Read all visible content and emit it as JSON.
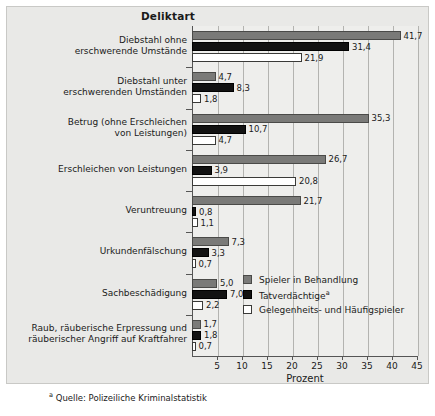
{
  "chart_data": {
    "type": "bar",
    "orientation": "horizontal",
    "title": "Deliktart",
    "xlabel": "Prozent",
    "ylabel": "Deliktart",
    "xlim": [
      0,
      45
    ],
    "xticks": [
      5,
      10,
      15,
      20,
      25,
      30,
      35,
      40,
      45
    ],
    "xticklabels": [
      "5",
      "10",
      "15",
      "20",
      "25",
      "30",
      "35",
      "40",
      "45"
    ],
    "grid": "vertical",
    "legend_position": "center-right-inside",
    "categories": [
      "Diebstahl ohne erschwerende Umstände",
      "Diebstahl unter erschwerenden Umständen",
      "Betrug (ohne Erschleichen von Leistungen)",
      "Erschleichen von Leistungen",
      "Veruntreuung",
      "Urkundenfälschung",
      "Sachbeschädigung",
      "Raub, räuberische Erpressung und räuberischer Angriff auf Kraftfahrer"
    ],
    "category_lines": [
      [
        "Diebstahl ohne",
        "erschwerende Umstände"
      ],
      [
        "Diebstahl unter",
        "erschwerenden Umständen"
      ],
      [
        "Betrug (ohne Erschleichen",
        "von Leistungen)"
      ],
      [
        "Erschleichen von Leistungen"
      ],
      [
        "Veruntreuung"
      ],
      [
        "Urkundenfälschung"
      ],
      [
        "Sachbeschädigung"
      ],
      [
        "Raub, räuberische Erpressung und",
        "räuberischer Angriff auf Kraftfahrer"
      ]
    ],
    "series": [
      {
        "name": "Spieler in Behandlung",
        "color": "#7a7a78",
        "values": [
          41.7,
          4.7,
          35.3,
          26.7,
          21.7,
          7.3,
          5.0,
          1.7
        ],
        "labels": [
          "41,7",
          "4,7",
          "35,3",
          "26,7",
          "21,7",
          "7,3",
          "5,0",
          "1,7"
        ]
      },
      {
        "name": "Tatverdächtige",
        "name_suffix": "a",
        "color": "#121212",
        "values": [
          31.4,
          8.3,
          10.7,
          3.9,
          0.8,
          3.3,
          7.0,
          1.8
        ],
        "labels": [
          "31,4",
          "8,3",
          "10,7",
          "3,9",
          "0,8",
          "3,3",
          "7,0",
          "1,8"
        ]
      },
      {
        "name": "Gelegenheits- und Häufigspieler",
        "color": "#ffffff",
        "values": [
          21.9,
          1.8,
          4.7,
          20.8,
          1.1,
          0.7,
          2.2,
          0.7
        ],
        "labels": [
          "21,9",
          "1,8",
          "4,7",
          "20,8",
          "1,1",
          "0,7",
          "2,2",
          "0,7"
        ]
      }
    ],
    "footnote": "Quelle: Polizeiliche Kriminalstatistik",
    "footnote_marker": "a",
    "colors": {
      "panel_background": "#e9e9e7",
      "plot_background": "#eeeeec",
      "gridline": "#b3b3b0",
      "axis": "#555555",
      "text": "#1a1a1a"
    }
  }
}
